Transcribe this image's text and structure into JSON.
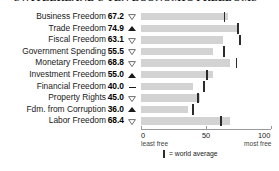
{
  "title": "SWITZERLAND'S TEN ECONOMIC FREEDOMS",
  "colors": {
    "bar": "#d3d3d3",
    "world_average_mark": "#2b2b2b",
    "axis": "#9a9a9a",
    "text": "#1a1a1a",
    "background": "#ffffff"
  },
  "legend": {
    "mark_name": "world-average-tick",
    "text": "= world average"
  },
  "axis": {
    "ticks": [
      {
        "value": 0,
        "label": "0",
        "sublabel": "least free"
      },
      {
        "value": 50,
        "label": "50",
        "sublabel": ""
      },
      {
        "value": 100,
        "label": "100",
        "sublabel": "most free"
      }
    ],
    "min": 0,
    "max": 100
  },
  "chart_data": {
    "type": "bar",
    "orientation": "horizontal",
    "title": "SWITZERLAND'S TEN ECONOMIC FREEDOMS",
    "xlabel": "",
    "ylabel": "",
    "xlim": [
      0,
      100
    ],
    "grid": false,
    "legend_position": "bottom",
    "categories": [
      "Business Freedom",
      "Trade Freedom",
      "Fiscal Freedom",
      "Government Spending",
      "Monetary Freedom",
      "Investment Freedom",
      "Financial Freedom",
      "Property Rights",
      "Fdm. from Corruption",
      "Labor Freedom"
    ],
    "values": [
      67.2,
      74.9,
      63.1,
      55.5,
      68.8,
      55.0,
      40.0,
      45.0,
      36.0,
      68.4
    ],
    "world_average": [
      64.3,
      74.8,
      76.3,
      63.9,
      73.4,
      50.5,
      48.5,
      43.6,
      40.3,
      61.5
    ],
    "trends": [
      "down",
      "up",
      "down",
      "down",
      "down",
      "up",
      "flat",
      "down",
      "up",
      "down"
    ]
  },
  "rows": [
    {
      "label": "Business Freedom",
      "value": "67.2",
      "trend": "down",
      "v": 67.2,
      "avg": 64.3
    },
    {
      "label": "Trade Freedom",
      "value": "74.9",
      "trend": "up",
      "v": 74.9,
      "avg": 74.8
    },
    {
      "label": "Fiscal Freedom",
      "value": "63.1",
      "trend": "down",
      "v": 63.1,
      "avg": 76.3
    },
    {
      "label": "Government Spending",
      "value": "55.5",
      "trend": "down",
      "v": 55.5,
      "avg": 63.9
    },
    {
      "label": "Monetary Freedom",
      "value": "68.8",
      "trend": "down",
      "v": 68.8,
      "avg": 73.4
    },
    {
      "label": "Investment Freedom",
      "value": "55.0",
      "trend": "up",
      "v": 55.0,
      "avg": 50.5
    },
    {
      "label": "Financial Freedom",
      "value": "40.0",
      "trend": "flat",
      "v": 40.0,
      "avg": 48.5
    },
    {
      "label": "Property Rights",
      "value": "45.0",
      "trend": "down",
      "v": 45.0,
      "avg": 43.6
    },
    {
      "label": "Fdm. from Corruption",
      "value": "36.0",
      "trend": "up",
      "v": 36.0,
      "avg": 40.3
    },
    {
      "label": "Labor Freedom",
      "value": "68.4",
      "trend": "down",
      "v": 68.4,
      "avg": 61.5
    }
  ]
}
